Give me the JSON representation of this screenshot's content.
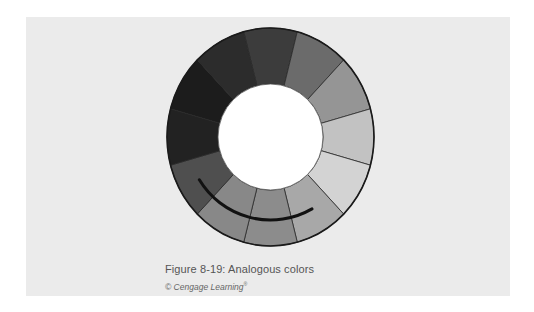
{
  "figure": {
    "caption": "Figure 8-19: Analogous colors",
    "credit": "© Cengage Learning",
    "credit_mark": "®"
  },
  "colors": {
    "page_background": "#ffffff",
    "panel_background": "#ebebeb",
    "outline": "#1a1a1a",
    "arc": "#111111",
    "center_fill": "#ffffff"
  },
  "wheel": {
    "center": [
      270.5,
      137
    ],
    "outer_radius": [
      103.5,
      109
    ],
    "inner_radius": [
      52.5,
      53
    ],
    "segment_count": 12,
    "first_boundary_deg": -105,
    "segments": [
      {
        "center_deg": -90,
        "fill": "#3c3c3c"
      },
      {
        "center_deg": -60,
        "fill": "#6b6b6b"
      },
      {
        "center_deg": -30,
        "fill": "#959595"
      },
      {
        "center_deg": 0,
        "fill": "#c2c2c2"
      },
      {
        "center_deg": 30,
        "fill": "#d3d3d3"
      },
      {
        "center_deg": 60,
        "fill": "#a8a8a8"
      },
      {
        "center_deg": 90,
        "fill": "#8c8c8c"
      },
      {
        "center_deg": 120,
        "fill": "#888888"
      },
      {
        "center_deg": 150,
        "fill": "#4f4f4f"
      },
      {
        "center_deg": 180,
        "fill": "#222222"
      },
      {
        "center_deg": 210,
        "fill": "#1c1c1c"
      },
      {
        "center_deg": 240,
        "fill": "#2c2c2c"
      }
    ],
    "analogous_arc": {
      "radius": 83,
      "start_deg": 149,
      "end_deg": 60,
      "stroke_width": 3
    }
  }
}
